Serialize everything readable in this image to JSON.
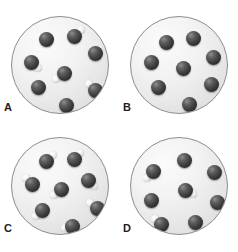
{
  "figure": {
    "cropped_top_text": "",
    "colors": {
      "vessel_fill_light": "#fbfbfb",
      "vessel_fill_dark": "#d8d8d8",
      "vessel_stroke": "#8c8c8c",
      "dark_atom": "#3b3b3b",
      "light_atom": "#f3f3f3",
      "label_text": "#1d1d1d",
      "background": "#ffffff"
    },
    "legend_note": "dark sphere = large atom; small white sphere = attached small atom"
  },
  "panels": [
    {
      "id": "a",
      "label": "A",
      "particle_count": 8,
      "plain_atom_count": 4,
      "molecule_count": 4,
      "particles": [
        {
          "x": 34,
          "y": 22,
          "type": "plain"
        },
        {
          "x": 62,
          "y": 19,
          "type": "molecule",
          "light_x": 69,
          "light_y": 13
        },
        {
          "x": 83,
          "y": 36,
          "type": "plain"
        },
        {
          "x": 19,
          "y": 45,
          "type": "molecule",
          "light_x": 26,
          "light_y": 51
        },
        {
          "x": 52,
          "y": 56,
          "type": "molecule",
          "light_x": 44,
          "light_y": 62
        },
        {
          "x": 26,
          "y": 70,
          "type": "plain"
        },
        {
          "x": 83,
          "y": 73,
          "type": "molecule",
          "light_x": 77,
          "light_y": 67
        },
        {
          "x": 54,
          "y": 88,
          "type": "plain"
        }
      ]
    },
    {
      "id": "b",
      "label": "B",
      "particle_count": 8,
      "plain_atom_count": 8,
      "molecule_count": 0,
      "particles": [
        {
          "x": 35,
          "y": 25,
          "type": "plain"
        },
        {
          "x": 62,
          "y": 21,
          "type": "plain"
        },
        {
          "x": 82,
          "y": 40,
          "type": "plain"
        },
        {
          "x": 20,
          "y": 45,
          "type": "plain"
        },
        {
          "x": 52,
          "y": 51,
          "type": "plain"
        },
        {
          "x": 27,
          "y": 70,
          "type": "plain"
        },
        {
          "x": 80,
          "y": 67,
          "type": "plain"
        },
        {
          "x": 58,
          "y": 87,
          "type": "plain"
        }
      ]
    },
    {
      "id": "c",
      "label": "C",
      "particle_count": 8,
      "plain_atom_count": 0,
      "molecule_count": 8,
      "particles": [
        {
          "x": 34,
          "y": 23,
          "type": "molecule",
          "light_x": 41,
          "light_y": 17
        },
        {
          "x": 62,
          "y": 21,
          "type": "molecule",
          "light_x": 68,
          "light_y": 15
        },
        {
          "x": 20,
          "y": 46,
          "type": "molecule",
          "light_x": 14,
          "light_y": 40
        },
        {
          "x": 76,
          "y": 42,
          "type": "molecule",
          "light_x": 82,
          "light_y": 48
        },
        {
          "x": 49,
          "y": 51,
          "type": "molecule",
          "light_x": 42,
          "light_y": 57
        },
        {
          "x": 85,
          "y": 70,
          "type": "molecule",
          "light_x": 78,
          "light_y": 65
        },
        {
          "x": 30,
          "y": 72,
          "type": "molecule",
          "light_x": 24,
          "light_y": 78
        },
        {
          "x": 60,
          "y": 88,
          "type": "molecule",
          "light_x": 53,
          "light_y": 90
        }
      ]
    },
    {
      "id": "d",
      "label": "D",
      "particle_count": 8,
      "plain_atom_count": 5,
      "molecule_count": 3,
      "particles": [
        {
          "x": 53,
          "y": 22,
          "type": "plain"
        },
        {
          "x": 22,
          "y": 33,
          "type": "molecule",
          "light_x": 16,
          "light_y": 40
        },
        {
          "x": 83,
          "y": 34,
          "type": "plain"
        },
        {
          "x": 54,
          "y": 52,
          "type": "molecule",
          "light_x": 62,
          "light_y": 56
        },
        {
          "x": 20,
          "y": 62,
          "type": "plain"
        },
        {
          "x": 86,
          "y": 64,
          "type": "plain"
        },
        {
          "x": 30,
          "y": 86,
          "type": "molecule",
          "light_x": 24,
          "light_y": 81
        },
        {
          "x": 64,
          "y": 84,
          "type": "plain"
        }
      ]
    }
  ]
}
